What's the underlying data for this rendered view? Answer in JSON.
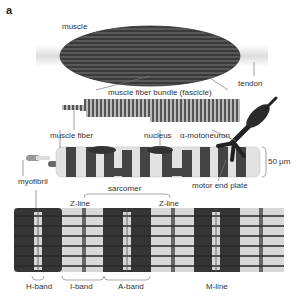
{
  "figure": {
    "panel_label": "a",
    "colors": {
      "dark": "#3a3a3a",
      "mid": "#6b6b6b",
      "light": "#d4d4d4",
      "background": "#ffffff",
      "line": "#777777"
    }
  },
  "labels": {
    "muscle": "muscle",
    "tendon": "tendon",
    "fascicle": "muscle fiber bundle (fascicle)",
    "muscle_fiber": "muscle fiber",
    "nucleus": "nucleus",
    "motoneuron": "α-motoneuron",
    "scale": "50 µm",
    "myofibril": "myofibril",
    "motor_end_plate": "motor end plate",
    "sarcomere": "sarcomer",
    "z_line_1": "Z-line",
    "z_line_2": "Z-line",
    "h_band": "H-band",
    "i_band": "I-band",
    "a_band": "A-band",
    "m_line": "M-line"
  }
}
